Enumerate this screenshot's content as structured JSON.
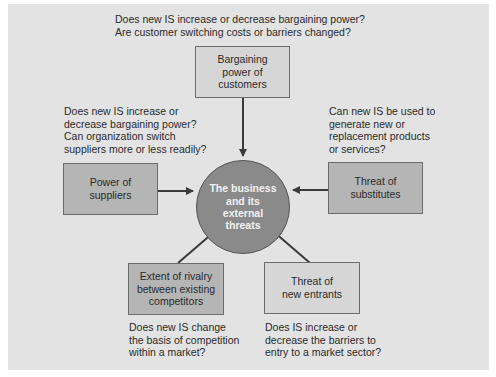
{
  "center": {
    "label": "The business\nand its\nexternal\nthreats"
  },
  "forces": {
    "customers": {
      "label": "Bargaining\npower of\ncustomers",
      "question": "Does new IS increase or decrease bargaining power?\nAre customer switching costs or barriers changed?"
    },
    "suppliers": {
      "label": "Power of\nsuppliers",
      "question": "Does new IS increase or\ndecrease bargaining power?\nCan organization switch\nsuppliers more or less readily?"
    },
    "substitutes": {
      "label": "Threat of\nsubstitutes",
      "question": "Can new IS be used to\ngenerate new or\nreplacement products\nor services?"
    },
    "rivalry": {
      "label": "Extent of rivalry\nbetween existing\ncompetitors",
      "question": "Does new IS change\nthe basis of competition\nwithin a market?"
    },
    "entrants": {
      "label": "Threat of\nnew entrants",
      "question": "Does IS increase or\ndecrease the barriers to\nentry to a market sector?"
    }
  },
  "colors": {
    "panel": "#e3e3e3",
    "box_dark": "#b5b5b5",
    "box_light": "#d6d6d6",
    "circle": "#8a8a8a",
    "arrow": "#3a3a3a"
  }
}
